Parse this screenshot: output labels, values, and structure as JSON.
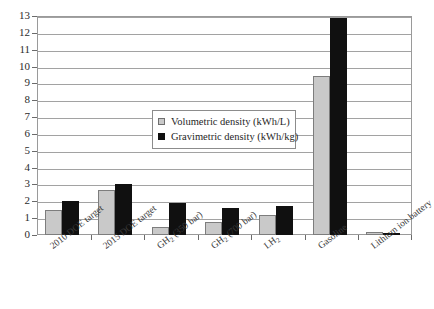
{
  "chart_data": {
    "type": "bar",
    "title": "",
    "subtitle": "",
    "xlabel": "",
    "ylabel": "",
    "ylim": [
      0,
      13
    ],
    "y_ticks": [
      "0",
      "1",
      "2",
      "3",
      "4",
      "5",
      "6",
      "7",
      "8",
      "9",
      "10",
      "11",
      "12",
      "13"
    ],
    "grid": true,
    "legend_position": "inside-center-left",
    "categories": [
      "2010 DOE target",
      "2015 DOE target",
      "GH2 (350 bar)",
      "GH2 (700 bar)",
      "LH2",
      "Gasoline",
      "Lithium ion battery"
    ],
    "category_labels_html": [
      "2010 DOE target",
      "2015 DOE target",
      "GH<sub>2</sub> (350 bar)",
      "GH<sub>2</sub> (700 bar)",
      "LH<sub>2</sub>",
      "Gasoline",
      "Lithium ion battery"
    ],
    "series": [
      {
        "name": "Volumetric density (kWh/L)",
        "color": "#c9c9c9",
        "values": [
          1.5,
          2.7,
          0.5,
          0.8,
          1.2,
          9.45,
          0.2
        ]
      },
      {
        "name": "Gravimetric density (kWh/kg)",
        "color": "#101010",
        "values": [
          2.0,
          3.0,
          1.9,
          1.6,
          1.7,
          12.9,
          0.1
        ]
      }
    ]
  },
  "legend": {
    "entries": [
      {
        "label": "Volumetric density (kWh/L)",
        "swatch": "volumetric"
      },
      {
        "label": "Gravimetric density (kWh/kg)",
        "swatch": "gravimetric"
      }
    ]
  }
}
